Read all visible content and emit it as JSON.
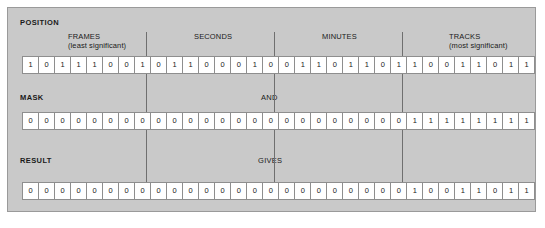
{
  "figure": {
    "panel_bg": "#c9c9c9",
    "cell_bg": "#ffffff",
    "border_color": "#8e8e8e"
  },
  "sections": {
    "position": {
      "title": "POSITION",
      "bits": [
        "1",
        "0",
        "1",
        "1",
        "1",
        "0",
        "0",
        "1",
        "0",
        "1",
        "1",
        "0",
        "0",
        "0",
        "1",
        "0",
        "0",
        "1",
        "1",
        "0",
        "1",
        "1",
        "0",
        "1",
        "1",
        "0",
        "0",
        "1",
        "1",
        "0",
        "1",
        "1"
      ]
    },
    "mask": {
      "title": "MASK",
      "operator": "AND",
      "bits": [
        "0",
        "0",
        "0",
        "0",
        "0",
        "0",
        "0",
        "0",
        "0",
        "0",
        "0",
        "0",
        "0",
        "0",
        "0",
        "0",
        "0",
        "0",
        "0",
        "0",
        "0",
        "0",
        "0",
        "0",
        "1",
        "1",
        "1",
        "1",
        "1",
        "1",
        "1",
        "1"
      ]
    },
    "result": {
      "title": "RESULT",
      "operator": "GIVES",
      "bits": [
        "0",
        "0",
        "0",
        "0",
        "0",
        "0",
        "0",
        "0",
        "0",
        "0",
        "0",
        "0",
        "0",
        "0",
        "0",
        "0",
        "0",
        "0",
        "0",
        "0",
        "0",
        "0",
        "0",
        "0",
        "1",
        "0",
        "0",
        "1",
        "1",
        "0",
        "1",
        "1"
      ]
    }
  },
  "groups": [
    {
      "name": "FRAMES",
      "sub": "(least significant)"
    },
    {
      "name": "SECONDS",
      "sub": ""
    },
    {
      "name": "MINUTES",
      "sub": ""
    },
    {
      "name": "TRACKS",
      "sub": "(most significant)"
    }
  ]
}
